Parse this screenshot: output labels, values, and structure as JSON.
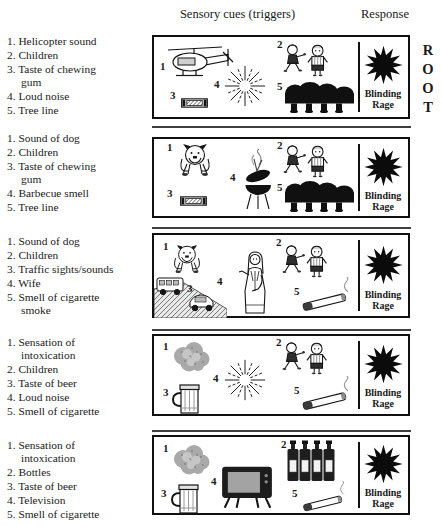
{
  "header": {
    "sensory_cues": "Sensory cues (triggers)",
    "response": "Response"
  },
  "root_letters": [
    "R",
    "O",
    "O",
    "T"
  ],
  "box_labels": [
    "1",
    "2",
    "3",
    "4",
    "5"
  ],
  "response_label": "Blinding Rage",
  "rows": [
    {
      "cues": [
        "1. Helicopter sound",
        "2. Children",
        "3. Taste of chewing\ngum",
        "4. Loud noise",
        "5. Tree line"
      ],
      "icons": [
        "helicopter",
        "children",
        "chewing-gum",
        "noise-starburst",
        "tree-line"
      ],
      "response": "Blinding Rage"
    },
    {
      "cues": [
        "1. Sound of dog",
        "2. Children",
        "3. Taste of chewing\ngum",
        "4. Barbecue smell",
        "5. Tree line"
      ],
      "icons": [
        "bulldog",
        "children",
        "chewing-gum",
        "barbecue-grill",
        "tree-line"
      ],
      "response": "Blinding Rage"
    },
    {
      "cues": [
        "1. Sound of dog",
        "2. Children",
        "3. Traffic sights/sounds",
        "4. Wife",
        "5. Smell of cigarette\nsmoke"
      ],
      "icons": [
        "bulldog",
        "children",
        "traffic",
        "wife",
        "cigarette"
      ],
      "response": "Blinding Rage"
    },
    {
      "cues": [
        "1. Sensation of\nintoxication",
        "2. Children",
        "3. Taste of beer",
        "4. Loud noise",
        "5. Smell of cigarette"
      ],
      "icons": [
        "intoxication-cloud",
        "children",
        "beer-mug",
        "noise-starburst",
        "cigarette"
      ],
      "response": "Blinding Rage"
    },
    {
      "cues": [
        "1. Sensation of\nintoxication",
        "2. Bottles",
        "3. Taste of beer",
        "4. Television",
        "5. Smell of cigarette"
      ],
      "icons": [
        "intoxication-cloud",
        "bottles",
        "beer-mug",
        "television",
        "cigarette"
      ],
      "response": "Blinding Rage"
    }
  ],
  "colors": {
    "ink": "#101010",
    "paper": "#ffffff",
    "shade": "#a9a9a9"
  }
}
